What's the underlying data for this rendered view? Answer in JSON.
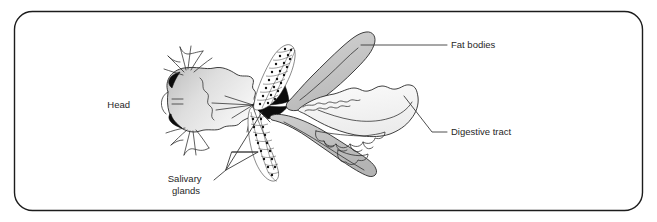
{
  "figure": {
    "kind": "labeled-anatomical-illustration",
    "frame": {
      "shape": "rounded-rectangle",
      "corner_radius_px": 18,
      "border_color": "#1c1c1c",
      "background_color": "#ffffff"
    },
    "palette": {
      "outline": "#2a2a2a",
      "leader_line": "#3a3a3a",
      "text": "#272727",
      "organ_gray_light": "#e2e2e2",
      "organ_gray_mid": "#c9c9c9",
      "organ_gray_dark": "#b0b0b0",
      "accent_black": "#0c0c0c",
      "paper": "#ffffff"
    },
    "labels": [
      {
        "id": "head",
        "text": "Head",
        "lines": [
          "Head"
        ],
        "anchor": "right",
        "x": 130,
        "y": 108,
        "leader": "none"
      },
      {
        "id": "fat-bodies",
        "text": "Fat bodies",
        "lines": [
          "Fat bodies"
        ],
        "anchor": "left",
        "x": 451,
        "y": 47,
        "leader": "horizontal"
      },
      {
        "id": "digestive-tract",
        "text": "Digestive tract",
        "lines": [
          "Digestive tract"
        ],
        "anchor": "left",
        "x": 451,
        "y": 135,
        "leader": "diagonal-then-horizontal"
      },
      {
        "id": "salivary-glands",
        "text": "Salivary glands",
        "lines": [
          "Salivary",
          "glands"
        ],
        "anchor": "center",
        "x": 186,
        "y": 182,
        "leader": "forked-triangle"
      }
    ],
    "structures": [
      {
        "id": "head",
        "name": "Head",
        "fill": "gradient-gray",
        "notes": "left end, with black eye wedges and two appendages"
      },
      {
        "id": "salivary-gland-upper",
        "name": "Salivary gland (upper)",
        "fill": "white",
        "texture": "beaded-cells"
      },
      {
        "id": "salivary-gland-lower",
        "name": "Salivary gland (lower)",
        "fill": "white",
        "texture": "beaded-cells"
      },
      {
        "id": "fat-body-upper",
        "name": "Fat body (upper lobe)",
        "fill": "gray"
      },
      {
        "id": "fat-body-lower",
        "name": "Fat body (lower lobe)",
        "fill": "gray"
      },
      {
        "id": "digestive-tract",
        "name": "Digestive tract",
        "fill": "very-light-gray",
        "notes": "large scalloped mass on the right with lobed caeca"
      },
      {
        "id": "convergence-wedge",
        "name": "Black convergence wedge",
        "fill": "black"
      }
    ]
  }
}
